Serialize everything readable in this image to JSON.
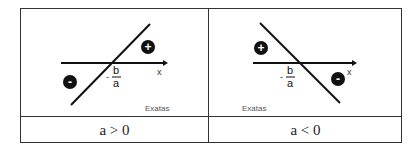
{
  "table": {
    "cells": [
      {
        "caption": "a > 0",
        "x_axis_label": "x",
        "root_label_sign": "-",
        "root_numerator": "b",
        "root_denominator": "a",
        "positive_sign": "+",
        "negative_sign": "-",
        "watermark": "Exatas"
      },
      {
        "caption": "a < 0",
        "x_axis_label": "x",
        "root_label_sign": "-",
        "root_numerator": "b",
        "root_denominator": "a",
        "positive_sign": "+",
        "negative_sign": "-",
        "watermark": "Exatas"
      }
    ]
  }
}
